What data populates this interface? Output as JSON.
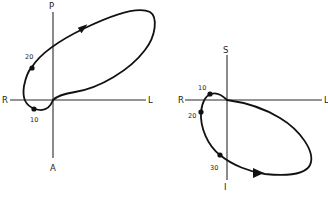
{
  "diagrams": [
    {
      "id": "left",
      "axes": {
        "top": "P",
        "bottom": "A",
        "left": "R",
        "right": "L"
      },
      "points": [
        {
          "label": "10"
        },
        {
          "label": "20"
        }
      ]
    },
    {
      "id": "right",
      "axes": {
        "top": "S",
        "bottom": "I",
        "left": "R",
        "right": "L"
      },
      "points": [
        {
          "label": "10"
        },
        {
          "label": "20"
        },
        {
          "label": "30"
        }
      ]
    }
  ],
  "colors": {
    "line": "#111111",
    "axis": "#2a2a2a",
    "background": "#ffffff"
  }
}
